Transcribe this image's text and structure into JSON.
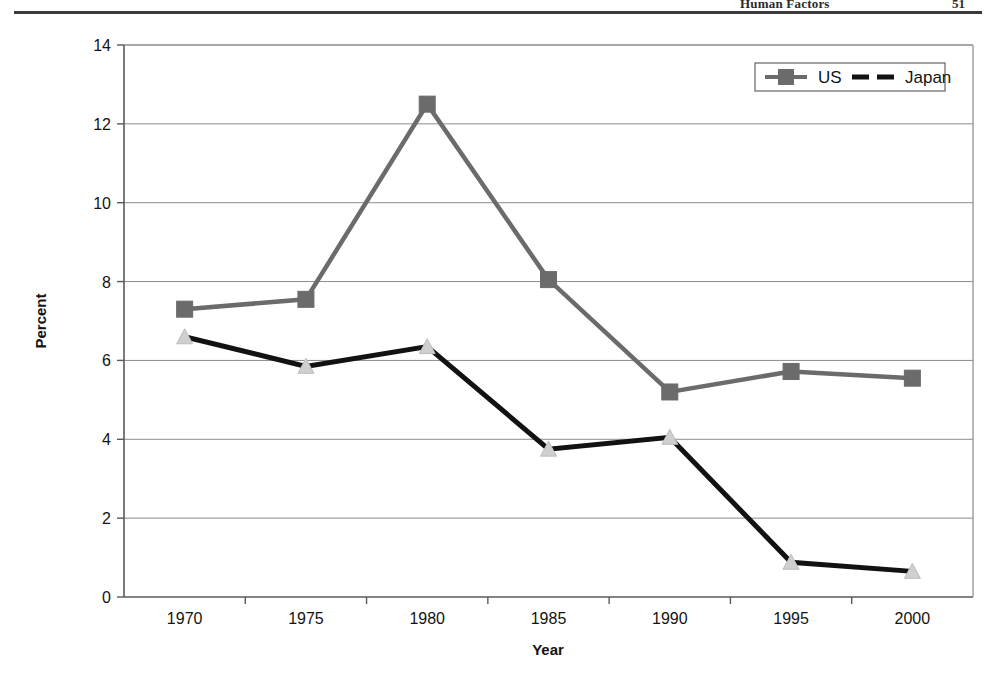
{
  "page_header": {
    "title": "Human Factors",
    "folio": "51"
  },
  "chart_data": {
    "type": "line",
    "title": "",
    "subtitle": "",
    "xlabel": "Year",
    "ylabel": "Percent",
    "categories": [
      "1970",
      "1975",
      "1980",
      "1985",
      "1990",
      "1995",
      "2000"
    ],
    "x": [
      1970,
      1975,
      1980,
      1985,
      1990,
      1995,
      2000
    ],
    "series": [
      {
        "name": "US",
        "values": [
          7.3,
          7.55,
          12.5,
          8.05,
          5.2,
          5.72,
          5.55
        ],
        "color": "#6b6b6b",
        "line_style": "solid",
        "marker": "square"
      },
      {
        "name": "Japan",
        "values": [
          6.6,
          5.85,
          6.35,
          3.75,
          4.05,
          0.88,
          0.65
        ],
        "color": "#121212",
        "line_style": "dashed",
        "marker": "triangle"
      }
    ],
    "ylim": [
      0,
      14
    ],
    "yticks": [
      0,
      2,
      4,
      6,
      8,
      10,
      12,
      14
    ],
    "ytick_labels": [
      "0",
      "2",
      "4",
      "6",
      "8",
      "10",
      "12",
      "14"
    ],
    "xtick_labels": [
      "1970",
      "1975",
      "1980",
      "1985",
      "1990",
      "1995",
      "2000"
    ],
    "grid": "horizontal",
    "legend_position": "top-right",
    "legend_entries": [
      "US",
      "Japan"
    ]
  }
}
